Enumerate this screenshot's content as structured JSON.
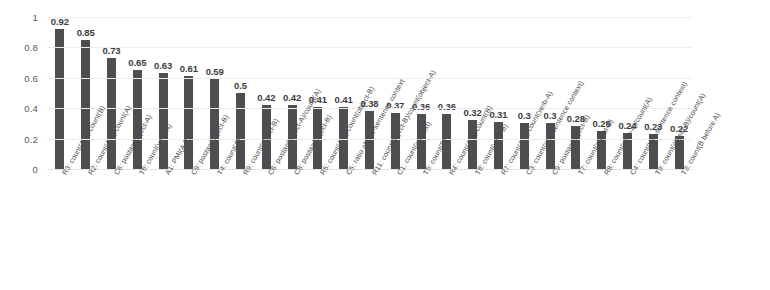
{
  "chart_data": {
    "type": "bar",
    "title": "",
    "subtitle": "",
    "xlabel": "",
    "ylabel": "",
    "ylim": [
      0,
      1
    ],
    "yticks": [
      "0",
      "0.2",
      "0.4",
      "0.6",
      "0.8",
      "1"
    ],
    "ytick_values": [
      0,
      0.2,
      0.4,
      0.6,
      0.8,
      1
    ],
    "grid": true,
    "legend": null,
    "legend_position": "none",
    "bar_color": "#4e4e50",
    "gridline_color": "#ededf0",
    "categories": [
      "R3: count(A,B)/count(B)",
      "R2: count(A,B)/count(A)",
      "C6: postag(object-A)",
      "T6: count(verb-A)",
      "A1: PMI(A,B)",
      "C9: postag(object-B)",
      "T4: count(A)",
      "R9: count(object-B)",
      "C6: postag(object-A)/count(A)",
      "C8: postag(object-B)",
      "R5: count(A,B)/count(object-B)",
      "C5: ratio of one-sentence context",
      "R11: count(object-B)/count(object-A)",
      "C1: count(context)",
      "T5: count(B)",
      "R4: count(A,B)/count(B)",
      "T8: count(verb-B)",
      "R7: count(A,B)/count(verb-A)",
      "C3: count(one-sentence context)",
      "C9: postag(object-B)",
      "T7: count(object-B)",
      "R8: count(verb-A)/count(A)",
      "C4: count(two-sentence context)",
      "T9: count(object-B)/count(A)",
      "T3: count(B before A)"
    ],
    "values": [
      0.92,
      0.85,
      0.73,
      0.65,
      0.63,
      0.61,
      0.59,
      0.5,
      0.42,
      0.42,
      0.41,
      0.41,
      0.38,
      0.37,
      0.36,
      0.36,
      0.32,
      0.31,
      0.3,
      0.3,
      0.28,
      0.25,
      0.24,
      0.23,
      0.22
    ],
    "value_labels": [
      "0.92",
      "0.85",
      "0.73",
      "0.65",
      "0.63",
      "0.61",
      "0.59",
      "0.5",
      "0.42",
      "0.42",
      "0.41",
      "0.41",
      "0.38",
      "0.37",
      "0.36",
      "0.36",
      "0.32",
      "0.31",
      "0.3",
      "0.3",
      "0.28",
      "0.25",
      "0.24",
      "0.23",
      "0.22"
    ]
  }
}
